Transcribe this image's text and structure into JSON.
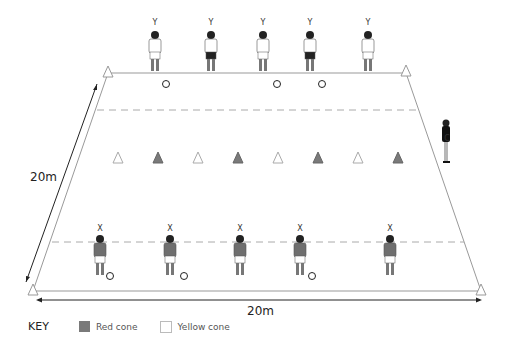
{
  "diagram": {
    "pitch": {
      "width_label": "20m",
      "length_label": "20m",
      "corners": [
        [
          108,
          72
        ],
        [
          406,
          71
        ],
        [
          481,
          290
        ],
        [
          33,
          290
        ]
      ]
    },
    "players_top": {
      "label": "Y",
      "positions": [
        155,
        211,
        263,
        310,
        368
      ],
      "balls": [
        166,
        277,
        322
      ]
    },
    "players_bottom": {
      "label": "X",
      "positions": [
        100,
        170,
        240,
        300,
        390
      ],
      "balls": [
        110,
        184,
        312
      ]
    },
    "coach": {
      "label": "C",
      "x": 446
    },
    "cones_middle": [
      "yellow",
      "red",
      "yellow",
      "red",
      "yellow",
      "red",
      "yellow",
      "red"
    ],
    "key": {
      "title": "KEY",
      "items": [
        {
          "label": "Red cone",
          "color": "#7a7a7a"
        },
        {
          "label": "Yellow cone",
          "color": "#ffffff"
        }
      ]
    }
  }
}
